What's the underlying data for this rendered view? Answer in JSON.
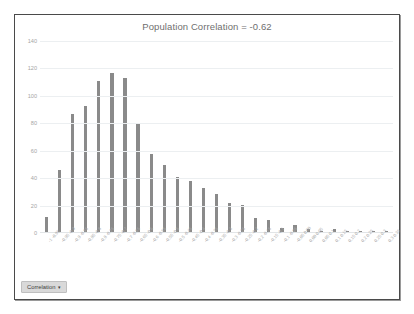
{
  "chart_data": {
    "type": "bar",
    "title": "Population Correlation = -0.62",
    "xlabel": "",
    "ylabel": "",
    "ylim": [
      0,
      140
    ],
    "yticks": [
      0,
      20,
      40,
      60,
      80,
      100,
      120,
      140
    ],
    "grid": true,
    "legend_position": "bottom-left",
    "series_name": "Correlation",
    "bar_color": "#8a8a8a",
    "categories": [
      "-1 -0.95",
      "-0.95 -0.9",
      "-0.9 -0.85",
      "-0.85 -0.8",
      "-0.8 -0.75",
      "-0.75 -0.7",
      "-0.7 -0.65",
      "-0.65 -0.6",
      "-0.6 -0.55",
      "-0.55 -0.5",
      "-0.5 -0.45",
      "-0.45 -0.4",
      "-0.4 -0.35",
      "-0.35 -0.3",
      "-0.3 -0.25",
      "-0.25 -0.2",
      "-0.2 -0.15",
      "-0.15 -0.1",
      "-0.1 -0.05",
      "-0.05 0.00",
      "0.00 0.05",
      "0.05 0.1",
      "0.1 0.15",
      "0.15 0.2",
      "0.2 0.25",
      "0.25 0.3",
      "0.3 0.35"
    ],
    "values": [
      11,
      45,
      86,
      92,
      110,
      116,
      112,
      79,
      57,
      49,
      40,
      37,
      32,
      28,
      21,
      20,
      10,
      9,
      3,
      5,
      2,
      1,
      2,
      1,
      1,
      1,
      1
    ]
  },
  "legend": {
    "label": "Correlation",
    "caret": "▾"
  }
}
